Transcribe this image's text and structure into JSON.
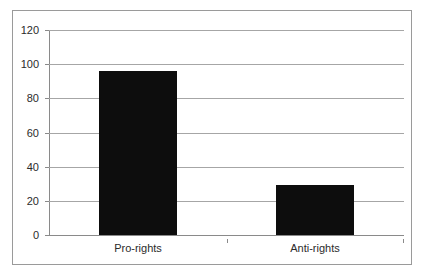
{
  "chart_data": {
    "type": "bar",
    "title": "",
    "subtitle": "",
    "xlabel": "",
    "ylabel": "",
    "categories": [
      "Pro-rights",
      "Anti-rights"
    ],
    "values": [
      96,
      29
    ],
    "series": [
      {
        "name": "",
        "values": [
          96,
          29
        ]
      }
    ],
    "ylim": [
      0,
      120
    ],
    "yticks": [
      0,
      20,
      40,
      60,
      80,
      100,
      120
    ],
    "ytick_labels": [
      "0",
      "20",
      "40",
      "60",
      "80",
      "100",
      "120"
    ],
    "grid": "horizontal",
    "legend": "none",
    "bar_color": "#0d0d0d",
    "gridline_color": "#a6a6a6",
    "axis_color": "#8a8a8a",
    "border_color": "#9a9a9a",
    "background_color": "#ffffff",
    "text_color": "#2b2b2b"
  }
}
